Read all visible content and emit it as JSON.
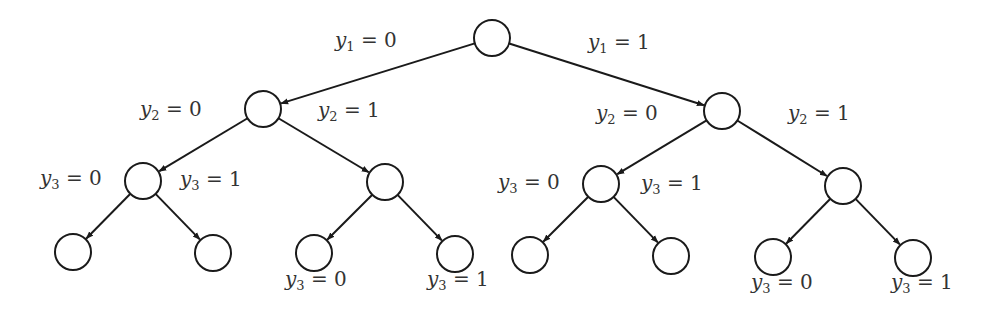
{
  "diagram": {
    "type": "binary-decision-tree",
    "stroke_color": "#1a1a1a",
    "text_color": "#333333",
    "node_radius": 18,
    "nodes": [
      {
        "id": "root",
        "x": 492,
        "y": 38
      },
      {
        "id": "n0",
        "x": 263,
        "y": 109
      },
      {
        "id": "n1",
        "x": 722,
        "y": 111
      },
      {
        "id": "n00",
        "x": 143,
        "y": 181
      },
      {
        "id": "n01",
        "x": 385,
        "y": 182
      },
      {
        "id": "n10",
        "x": 601,
        "y": 184
      },
      {
        "id": "n11",
        "x": 843,
        "y": 186
      },
      {
        "id": "n000",
        "x": 73,
        "y": 252
      },
      {
        "id": "n001",
        "x": 213,
        "y": 253
      },
      {
        "id": "n010",
        "x": 314,
        "y": 253
      },
      {
        "id": "n011",
        "x": 455,
        "y": 254
      },
      {
        "id": "n100",
        "x": 530,
        "y": 255
      },
      {
        "id": "n101",
        "x": 671,
        "y": 256
      },
      {
        "id": "n110",
        "x": 773,
        "y": 257
      },
      {
        "id": "n111",
        "x": 913,
        "y": 258
      }
    ],
    "edges": [
      {
        "from": "root",
        "to": "n0"
      },
      {
        "from": "root",
        "to": "n1"
      },
      {
        "from": "n0",
        "to": "n00"
      },
      {
        "from": "n0",
        "to": "n01"
      },
      {
        "from": "n1",
        "to": "n10"
      },
      {
        "from": "n1",
        "to": "n11"
      },
      {
        "from": "n00",
        "to": "n000"
      },
      {
        "from": "n00",
        "to": "n001"
      },
      {
        "from": "n01",
        "to": "n010"
      },
      {
        "from": "n01",
        "to": "n011"
      },
      {
        "from": "n10",
        "to": "n100"
      },
      {
        "from": "n10",
        "to": "n101"
      },
      {
        "from": "n11",
        "to": "n110"
      },
      {
        "from": "n11",
        "to": "n111"
      }
    ],
    "labels": [
      {
        "var": "y",
        "sub": "1",
        "rhs": " = 0",
        "x": 335,
        "y": 48
      },
      {
        "var": "y",
        "sub": "1",
        "rhs": " = 1",
        "x": 588,
        "y": 50
      },
      {
        "var": "y",
        "sub": "2",
        "rhs": " = 0",
        "x": 140,
        "y": 117
      },
      {
        "var": "y",
        "sub": "2",
        "rhs": " = 1",
        "x": 318,
        "y": 118
      },
      {
        "var": "y",
        "sub": "2",
        "rhs": " = 0",
        "x": 596,
        "y": 121
      },
      {
        "var": "y",
        "sub": "2",
        "rhs": " = 1",
        "x": 788,
        "y": 121
      },
      {
        "var": "y",
        "sub": "3",
        "rhs": " = 0",
        "x": 40,
        "y": 186
      },
      {
        "var": "y",
        "sub": "3",
        "rhs": " = 1",
        "x": 180,
        "y": 187
      },
      {
        "var": "y",
        "sub": "3",
        "rhs": " = 0",
        "x": 285,
        "y": 287
      },
      {
        "var": "y",
        "sub": "3",
        "rhs": " = 1",
        "x": 427,
        "y": 287
      },
      {
        "var": "y",
        "sub": "3",
        "rhs": " = 0",
        "x": 498,
        "y": 190
      },
      {
        "var": "y",
        "sub": "3",
        "rhs": " = 1",
        "x": 641,
        "y": 191
      },
      {
        "var": "y",
        "sub": "3",
        "rhs": " = 0",
        "x": 751,
        "y": 290
      },
      {
        "var": "y",
        "sub": "3",
        "rhs": " = 1",
        "x": 891,
        "y": 290
      }
    ]
  }
}
